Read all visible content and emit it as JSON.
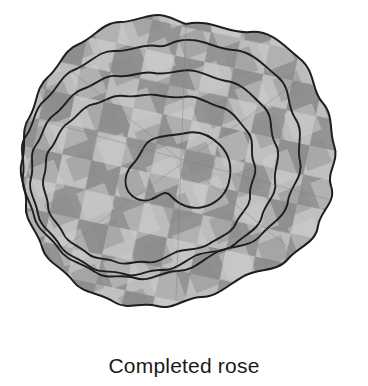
{
  "figure": {
    "caption": "Completed rose",
    "background_color": "#ffffff",
    "caption_color": "#1a1a1a"
  },
  "illustration": {
    "name": "completed-rose",
    "style": "scanned-grayscale-line-drawing",
    "outline_color": "#1a1a1a",
    "outline_width_px": 1.8,
    "fabric_colors": {
      "mid_gray": "#9a9a9a",
      "dark_gray": "#868686",
      "light_gray": "#c4c4c4",
      "lighter_gray": "#d2d2d2",
      "shadow_gray": "#8c8c8c"
    },
    "patch_grid": {
      "cell_size_px": 30,
      "rotation_deg": 12,
      "description": "checkerboard of light and dark fabric squares"
    },
    "petal_rings": [
      {
        "name": "outer-petal-ring",
        "index": 0,
        "radius_px": 155,
        "wave_lobes": 11,
        "wave_amplitude_px": 13
      },
      {
        "name": "second-petal-ring",
        "index": 1,
        "radius_px": 116,
        "wave_lobes": 9,
        "wave_amplitude_px": 11
      },
      {
        "name": "third-petal-ring",
        "index": 2,
        "radius_px": 84,
        "wave_lobes": 8,
        "wave_amplitude_px": 9
      },
      {
        "name": "inner-petal-ring",
        "index": 3,
        "radius_px": 56,
        "wave_lobes": 7,
        "wave_amplitude_px": 7
      },
      {
        "name": "rose-center-bud",
        "index": 4,
        "radius_px": 29,
        "wave_lobes": 5,
        "wave_amplitude_px": 5
      }
    ],
    "center_point": {
      "x": 186,
      "y": 178
    }
  }
}
